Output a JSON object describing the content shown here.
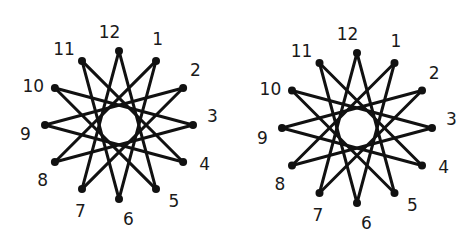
{
  "diagrams": [
    {
      "name": "left-star",
      "description": "Twelve clock positions joined as a {12/5} star polygon",
      "labels": [
        "12",
        "1",
        "2",
        "3",
        "4",
        "5",
        "6",
        "7",
        "8",
        "9",
        "10",
        "11"
      ],
      "step": 5
    },
    {
      "name": "right-star",
      "description": "Twelve clock positions joined as a {12/5} star polygon",
      "labels": [
        "12",
        "1",
        "2",
        "3",
        "4",
        "5",
        "6",
        "7",
        "8",
        "9",
        "10",
        "11"
      ],
      "step": 5
    }
  ],
  "colors": {
    "ink": "#111111",
    "background": "#ffffff"
  }
}
